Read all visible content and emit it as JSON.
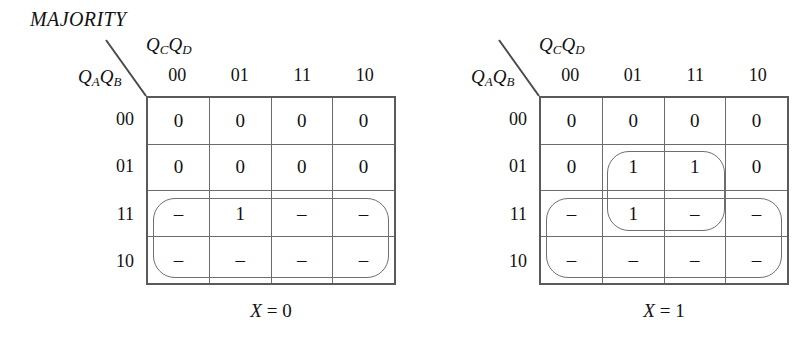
{
  "figure": {
    "title": "MAJORITY",
    "variables": {
      "column_var": "Q",
      "column_var_sub_1": "C",
      "column_var_2": "Q",
      "column_var_sub_2": "D",
      "row_var": "Q",
      "row_var_sub_1": "A",
      "row_var_2": "Q",
      "row_var_sub_2": "B"
    }
  },
  "maps": [
    {
      "id": "kmap-x0",
      "caption_var": "X",
      "caption_eq": "= 0",
      "column_headers": [
        "00",
        "01",
        "11",
        "10"
      ],
      "row_headers": [
        "00",
        "01",
        "11",
        "10"
      ],
      "cells": [
        [
          "0",
          "0",
          "0",
          "0"
        ],
        [
          "0",
          "0",
          "0",
          "0"
        ],
        [
          "–",
          "1",
          "–",
          "–"
        ],
        [
          "–",
          "–",
          "–",
          "–"
        ]
      ],
      "groups": [
        {
          "name": "group-rows-11-10-all-columns",
          "rows": [
            2,
            3
          ],
          "cols": [
            0,
            3
          ]
        }
      ]
    },
    {
      "id": "kmap-x1",
      "caption_var": "X",
      "caption_eq": "= 1",
      "column_headers": [
        "00",
        "01",
        "11",
        "10"
      ],
      "row_headers": [
        "00",
        "01",
        "11",
        "10"
      ],
      "cells": [
        [
          "0",
          "0",
          "0",
          "0"
        ],
        [
          "0",
          "1",
          "1",
          "0"
        ],
        [
          "–",
          "1",
          "–",
          "–"
        ],
        [
          "–",
          "–",
          "–",
          "–"
        ]
      ],
      "groups": [
        {
          "name": "group-rows-01-11-cols-01-11",
          "rows": [
            1,
            2
          ],
          "cols": [
            1,
            2
          ]
        },
        {
          "name": "group-rows-11-10-all-columns",
          "rows": [
            2,
            3
          ],
          "cols": [
            0,
            3
          ]
        }
      ]
    }
  ],
  "style": {
    "grid_border_color": "#5a5a5a",
    "cell_border_color": "#6b6b6b",
    "oval_color": "#6f6f6f",
    "background": "#ffffff",
    "text_color": "#111111"
  },
  "geometry": {
    "grid_left_x": 146,
    "grid_right_x": 511,
    "grid_top": 96,
    "grid_width": 250,
    "grid_height": 189,
    "cell_w": 62.5,
    "cell_h": 47.25
  }
}
